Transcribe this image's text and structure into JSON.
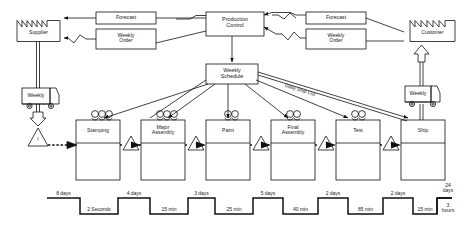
{
  "diagram": {
    "external_entities": [
      {
        "id": "supplier",
        "label": "Supplier",
        "icon": "factory-icon"
      },
      {
        "id": "customer",
        "label": "Customer",
        "icon": "factory-icon"
      }
    ],
    "control_boxes": [
      {
        "id": "production-control",
        "label": "Production\nControl"
      },
      {
        "id": "weekly-schedule",
        "label": "Weekly\nSchedule"
      }
    ],
    "info_boxes": [
      {
        "id": "forecast-supplier",
        "label": "Forecast"
      },
      {
        "id": "weekly-order-supplier",
        "label": "Weekly\nOrder"
      },
      {
        "id": "forecast-customer",
        "label": "Forecast"
      },
      {
        "id": "weekly-order-customer",
        "label": "Weekly\nOrder"
      }
    ],
    "shipments": [
      {
        "id": "inbound-truck",
        "label": "Weekly",
        "icon": "truck-icon"
      },
      {
        "id": "outbound-truck",
        "label": "Weekly",
        "icon": "truck-icon"
      }
    ],
    "annotations": [
      {
        "id": "daily-ship-list",
        "label": "Daily Ship List"
      }
    ],
    "processes": [
      {
        "id": "stamping",
        "label": "Stamping"
      },
      {
        "id": "major-assembly",
        "label": "Major\nAssembly"
      },
      {
        "id": "paint",
        "label": "Paint"
      },
      {
        "id": "final-assembly",
        "label": "Final\nAssembly"
      },
      {
        "id": "test",
        "label": "Test"
      },
      {
        "id": "ship",
        "label": "Ship"
      }
    ],
    "inventory_markers": [
      {
        "id": "inv-0",
        "label": "I"
      },
      {
        "id": "inv-1",
        "label": "I"
      },
      {
        "id": "inv-2",
        "label": "I"
      },
      {
        "id": "inv-3",
        "label": "I"
      },
      {
        "id": "inv-4",
        "label": "I"
      },
      {
        "id": "inv-5",
        "label": "I"
      }
    ],
    "timeline": {
      "lead_times": [
        "8 days",
        "4 days",
        "3 days",
        "5 days",
        "2 days",
        "2 days"
      ],
      "process_times": [
        "2 Seconds",
        "15 min",
        "25 min",
        "40 min",
        "85 min",
        "15 min"
      ],
      "total_lead_time": "24\ndays",
      "total_process_time": "3\nhours"
    }
  }
}
